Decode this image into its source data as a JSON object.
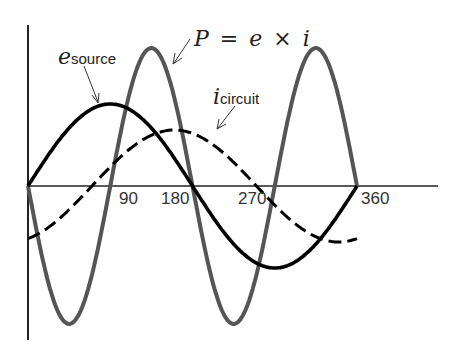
{
  "figure": {
    "labels": {
      "e_source_var": "e",
      "e_source_sub": "source",
      "i_circuit_var": "i",
      "i_circuit_sub": "circuit",
      "power_eq": "P = e × i"
    },
    "ticks": [
      "90",
      "180",
      "270",
      "360"
    ],
    "colors": {
      "voltage": "#000000",
      "current": "#000000",
      "power": "#555555",
      "axis": "#222222"
    }
  },
  "chart_data": {
    "type": "line",
    "title": "",
    "xlabel": "degrees",
    "ylabel": "",
    "x_ticks": [
      90,
      180,
      270,
      360
    ],
    "xlim": [
      0,
      360
    ],
    "grid": false,
    "series": [
      {
        "name": "e_source",
        "style": "solid black",
        "function": "sin(θ)",
        "amplitude": 1.0,
        "phase_deg": 0
      },
      {
        "name": "i_circuit",
        "style": "dashed black",
        "function": "sin(θ - 30°)·0.66 approx (lagging current)",
        "amplitude": 0.66,
        "phase_deg": -30
      },
      {
        "name": "P = e × i",
        "style": "solid grey",
        "function": "double-frequency power curve",
        "amplitude": 1.7,
        "frequency_multiplier": 2
      }
    ],
    "annotations": [
      "e_source",
      "i_circuit",
      "P = e × i"
    ]
  }
}
